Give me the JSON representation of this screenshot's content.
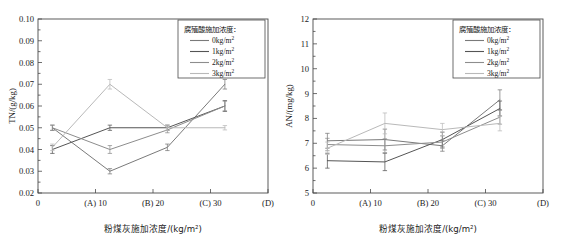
{
  "figure": {
    "panels": [
      "left",
      "right"
    ]
  },
  "legend": {
    "title": "腐殖酸施加浓度：",
    "entries": [
      {
        "label": "0kg/m",
        "sup": "2",
        "color": "#7a7a7a"
      },
      {
        "label": "1kg/m",
        "sup": "2",
        "color": "#555555"
      },
      {
        "label": "2kg/m",
        "sup": "2",
        "color": "#8d8d8d"
      },
      {
        "label": "3kg/m",
        "sup": "2",
        "color": "#b9b9b9"
      }
    ]
  },
  "xaxis": {
    "label_prefix": "粉煤灰施加浓度/(kg/m",
    "label_sup": "2",
    "label_suffix": ")",
    "ticks": [
      "0",
      "(A) 10",
      "(B) 20",
      "(C) 30",
      "(D)"
    ],
    "tick_values": [
      0,
      10,
      20,
      30,
      40
    ],
    "range": [
      0,
      40
    ]
  },
  "chart_data": [
    {
      "type": "line",
      "panel": "left",
      "title": "",
      "xlabel": "粉煤灰施加浓度/(kg/m2)",
      "ylabel": "TN/(g/kg)",
      "xlim": [
        0,
        40
      ],
      "ylim": [
        0.02,
        0.1
      ],
      "ytick_labels": [
        "0.02",
        "0.03",
        "0.04",
        "0.05",
        "0.06",
        "0.07",
        "0.08",
        "0.09",
        "0.10"
      ],
      "ytick_values": [
        0.02,
        0.03,
        0.04,
        0.05,
        0.06,
        0.07,
        0.08,
        0.09,
        0.1
      ],
      "xtick_labels": [
        "0",
        "(A) 10",
        "(B) 20",
        "(C) 30",
        "(D)"
      ],
      "x": [
        2.5,
        12.5,
        22.5,
        32.5
      ],
      "grid": false,
      "legend_position": "top-right",
      "series": [
        {
          "name": "0kg/m2",
          "color": "#7a7a7a",
          "values": [
            0.05,
            0.03,
            0.041,
            0.07
          ],
          "errors": [
            0.0012,
            0.0012,
            0.0015,
            0.0022
          ]
        },
        {
          "name": "1kg/m2",
          "color": "#555555",
          "values": [
            0.04,
            0.05,
            0.05,
            0.06
          ],
          "errors": [
            0.0018,
            0.0012,
            0.0012,
            0.0025
          ]
        },
        {
          "name": "2kg/m2",
          "color": "#8d8d8d",
          "values": [
            0.05,
            0.04,
            0.049,
            0.06
          ],
          "errors": [
            0.0012,
            0.0018,
            0.0013,
            0.0022
          ]
        },
        {
          "name": "3kg/m2",
          "color": "#b9b9b9",
          "values": [
            0.041,
            0.07,
            0.05,
            0.05
          ],
          "errors": [
            0.0015,
            0.0022,
            0.0013,
            0.001
          ]
        }
      ]
    },
    {
      "type": "line",
      "panel": "right",
      "title": "",
      "xlabel": "粉煤灰施加浓度/(kg/m2)",
      "ylabel": "AN/(mg/kg)",
      "xlim": [
        0,
        40
      ],
      "ylim": [
        5,
        12
      ],
      "ytick_labels": [
        "5",
        "6",
        "7",
        "8",
        "9",
        "10",
        "11",
        "12"
      ],
      "ytick_values": [
        5,
        6,
        7,
        8,
        9,
        10,
        11,
        12
      ],
      "xtick_labels": [
        "0",
        "(A) 10",
        "(B) 20",
        "(C) 30",
        "(D)"
      ],
      "x": [
        2.5,
        12.5,
        22.5,
        32.5
      ],
      "grid": false,
      "legend_position": "top-right",
      "series": [
        {
          "name": "0kg/m2",
          "color": "#7a7a7a",
          "values": [
            7.1,
            7.15,
            6.9,
            8.75
          ],
          "errors": [
            0.3,
            0.42,
            0.22,
            0.4
          ]
        },
        {
          "name": "1kg/m2",
          "color": "#555555",
          "values": [
            6.3,
            6.25,
            7.15,
            8.4
          ],
          "errors": [
            0.3,
            0.35,
            0.3,
            0.3
          ]
        },
        {
          "name": "2kg/m2",
          "color": "#8d8d8d",
          "values": [
            6.95,
            6.9,
            7.05,
            8.05
          ],
          "errors": [
            0.25,
            0.28,
            0.25,
            0.28
          ]
        },
        {
          "name": "3kg/m2",
          "color": "#b9b9b9",
          "values": [
            6.8,
            7.8,
            7.55,
            7.8
          ],
          "errors": [
            0.25,
            0.42,
            0.25,
            0.3
          ]
        }
      ]
    }
  ]
}
